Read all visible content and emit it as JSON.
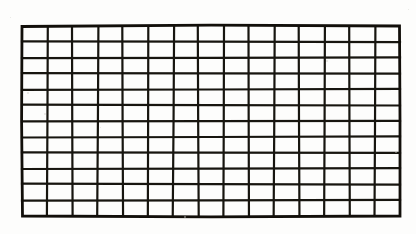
{
  "figure": {
    "style": "hand-drawn ink on paper",
    "background_color": "#fdfdfc",
    "line_color": "#17150f",
    "line_width_px": 2.2,
    "border_width_px": 2.8
  },
  "grid": {
    "columns": 15,
    "rows": 12,
    "cell_count": 180,
    "cell_width_px": 25.2,
    "cell_height_px": 15.8,
    "bounds": {
      "left": 22,
      "top": 26,
      "right": 400,
      "bottom": 216,
      "width": 378,
      "height": 190
    },
    "column_x": [
      22,
      47.2,
      72.4,
      97.6,
      122.8,
      148,
      173.2,
      198.4,
      223.6,
      248.8,
      274,
      299.2,
      324.4,
      349.6,
      374.8,
      400
    ],
    "row_y": [
      26,
      41.8,
      57.7,
      73.5,
      89.3,
      105.2,
      121,
      136.8,
      152.7,
      168.5,
      184.3,
      200.2,
      216
    ],
    "column_jitter": [
      0,
      0.6,
      -0.4,
      0.8,
      -0.5,
      0.3,
      0.9,
      -0.6,
      0.4,
      -0.3,
      0.7,
      -0.5,
      0.5,
      -0.4,
      0.6,
      0
    ],
    "row_jitter": [
      0,
      -0.4,
      0.5,
      -0.3,
      0.6,
      -0.5,
      0.3,
      0.7,
      -0.4,
      0.5,
      -0.6,
      0.4,
      0
    ]
  },
  "specks": [
    {
      "x": 27,
      "y": 92,
      "size": 2
    },
    {
      "x": 44,
      "y": 113,
      "size": 2
    },
    {
      "x": 100,
      "y": 127,
      "size": 1
    },
    {
      "x": 326,
      "y": 60,
      "size": 2
    },
    {
      "x": 395,
      "y": 151,
      "size": 2
    },
    {
      "x": 184,
      "y": 216,
      "size": 2
    },
    {
      "x": 10,
      "y": 17,
      "size": 1
    },
    {
      "x": 408,
      "y": 9,
      "size": 1
    }
  ]
}
